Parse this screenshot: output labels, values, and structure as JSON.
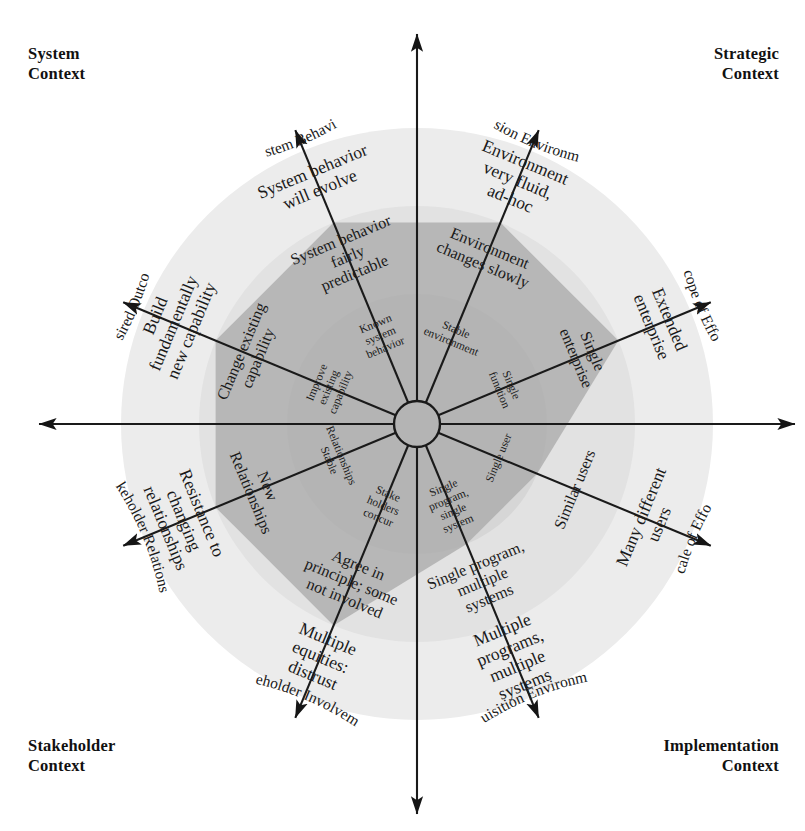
{
  "corners": {
    "top_left": [
      "System",
      "Context"
    ],
    "top_right": [
      "Strategic",
      "Context"
    ],
    "bottom_left": [
      "Stakeholder",
      "Context"
    ],
    "bottom_right": [
      "Implementation",
      "Context"
    ]
  },
  "colors": {
    "background": "#ffffff",
    "ring_outer": "#ececec",
    "ring_middle": "#e2e2e2",
    "ring_inner": "#d6d6d6",
    "profile_polygon": "#aaaaaa",
    "axis_line": "#1a1a1a",
    "text": "#1a1a1a"
  },
  "chart_data": {
    "type": "radar",
    "axis_count": 8,
    "rings": 3,
    "ring_labels": [
      "inner (low complexity)",
      "middle",
      "outer (high complexity)"
    ],
    "legend_position": "none",
    "grid": true,
    "axes": [
      {
        "name": "System Behavior",
        "angle_deg": 112.5,
        "context": "System Context",
        "levels": [
          {
            "ring": "inner",
            "label": "Known system behavior"
          },
          {
            "ring": "middle",
            "label": "System behavior fairly predictable"
          },
          {
            "ring": "outer",
            "label": "System behavior will evolve"
          }
        ],
        "profile_value": 2
      },
      {
        "name": "Mission Environment",
        "angle_deg": 67.5,
        "context": "Strategic Context",
        "levels": [
          {
            "ring": "inner",
            "label": "Stable environment"
          },
          {
            "ring": "middle",
            "label": "Environment changes slowly"
          },
          {
            "ring": "outer",
            "label": "Environment very fluid, ad-hoc"
          }
        ],
        "profile_value": 2
      },
      {
        "name": "Scope of Effort",
        "angle_deg": 22.5,
        "context": "Strategic Context",
        "levels": [
          {
            "ring": "inner",
            "label": "Single function"
          },
          {
            "ring": "middle",
            "label": "Single enterprise"
          },
          {
            "ring": "outer",
            "label": "Extended enterprise"
          }
        ],
        "profile_value": 2
      },
      {
        "name": "Scale of Effort",
        "angle_deg": 337.5,
        "context": "Implementation Context",
        "levels": [
          {
            "ring": "inner",
            "label": "Single user"
          },
          {
            "ring": "middle",
            "label": "Similar users"
          },
          {
            "ring": "outer",
            "label": "Many different users"
          }
        ],
        "profile_value": 1
      },
      {
        "name": "Acquisition Environment",
        "angle_deg": 292.5,
        "context": "Implementation Context",
        "levels": [
          {
            "ring": "inner",
            "label": "Single program, single system"
          },
          {
            "ring": "middle",
            "label": "Single program, multiple systems"
          },
          {
            "ring": "outer",
            "label": "Multiple programs, multiple systems"
          }
        ],
        "profile_value": 1
      },
      {
        "name": "Stakeholder Involvement",
        "angle_deg": 247.5,
        "context": "Stakeholder Context",
        "levels": [
          {
            "ring": "inner",
            "label": "Stake holders concur"
          },
          {
            "ring": "middle",
            "label": "Agree in principle; some not involved"
          },
          {
            "ring": "outer",
            "label": "Multiple equities: distrust"
          }
        ],
        "profile_value": 2
      },
      {
        "name": "Stakeholder Relationship",
        "angle_deg": 202.5,
        "context": "Stakeholder Context",
        "levels": [
          {
            "ring": "inner",
            "label": "Relationships Stable"
          },
          {
            "ring": "middle",
            "label": "New Relationships"
          },
          {
            "ring": "outer",
            "label": "Resistance to changing relationships"
          }
        ],
        "profile_value": 2
      },
      {
        "name": "Desired Outcome",
        "angle_deg": 157.5,
        "context": "System Context",
        "levels": [
          {
            "ring": "inner",
            "label": "Improve existing capability"
          },
          {
            "ring": "middle",
            "label": "Change existing capability"
          },
          {
            "ring": "outer",
            "label": "Build fundamentally new capability"
          }
        ],
        "profile_value": 2
      }
    ]
  }
}
